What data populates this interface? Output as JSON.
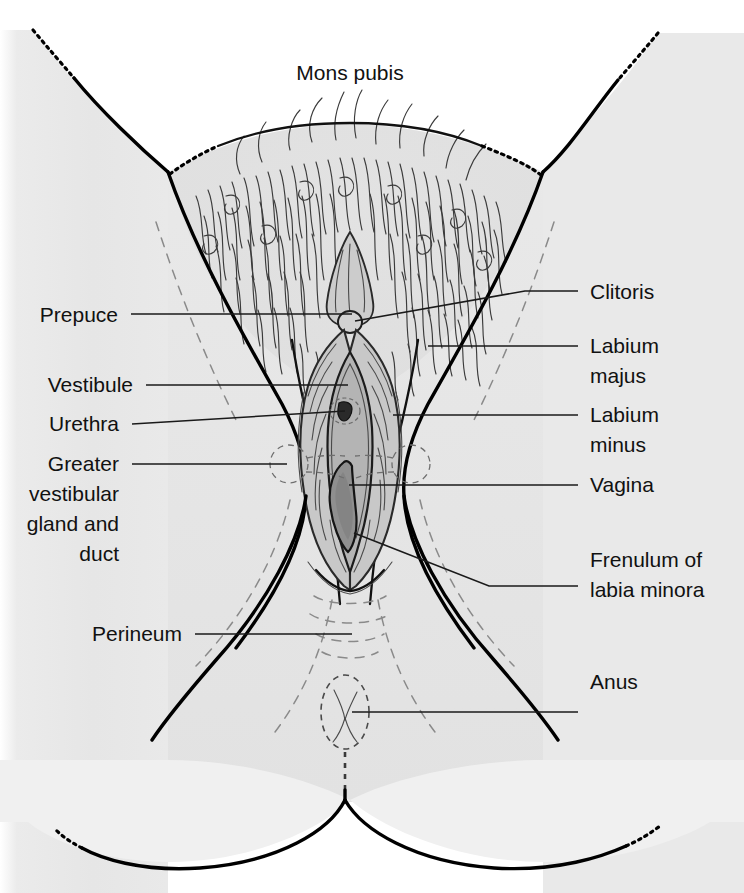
{
  "figure": {
    "view": "anterior / lithotomy view",
    "style": "line drawing with grayscale shading"
  },
  "colors": {
    "background": "#ffffff",
    "skin_fill": "#e4e4e4",
    "skin_fill_light": "#ededed",
    "labium_minus_fill": "#c8c8c8",
    "vestibule_fill": "#b4b4b4",
    "vaginal_opening_fill": "#8f8f8f",
    "outline": "#000000",
    "leader_line": "#1a1a1a",
    "text": "#111111",
    "hair": "#3b3b3b",
    "dashed_guide": "#8a8a8a"
  },
  "labels": {
    "top": [
      {
        "id": "mons-pubis",
        "text": "Mons pubis",
        "x": 350,
        "y": 80,
        "align": "center",
        "has_leader": false
      }
    ],
    "left": [
      {
        "id": "prepuce",
        "text": "Prepuce",
        "x": 118,
        "y": 322,
        "align": "end",
        "leader": "M 131 314 L 352 314"
      },
      {
        "id": "vestibule",
        "text": "Vestibule",
        "x": 133,
        "y": 392,
        "align": "end",
        "leader": "M 146 385 L 348 385"
      },
      {
        "id": "urethra",
        "text": "Urethra",
        "x": 119,
        "y": 431,
        "align": "end",
        "leader": "M 132 424 L 345 411"
      },
      {
        "id": "greater-vestibular-gland-and-duct",
        "text": "Greater",
        "lines": [
          "Greater",
          "vestibular",
          "gland and",
          "duct"
        ],
        "x": 119,
        "y": 471,
        "align": "end",
        "line_y": [
          471,
          501,
          531,
          561
        ],
        "leader": "M 132 464 L 287 464"
      },
      {
        "id": "perineum",
        "text": "Perineum",
        "x": 182,
        "y": 641,
        "align": "end",
        "leader": "M 195 634 L 352 634"
      }
    ],
    "right": [
      {
        "id": "clitoris",
        "text": "Clitoris",
        "x": 590,
        "y": 299,
        "align": "start",
        "leader": "M 355 321 L 525 291 L 578 291"
      },
      {
        "id": "labium-majus",
        "text": "Labium majus",
        "lines": [
          "Labium",
          "majus"
        ],
        "x": 590,
        "y": 353,
        "align": "start",
        "line_y": [
          353,
          383
        ],
        "leader": "M 428 346 L 578 346"
      },
      {
        "id": "labium-minus",
        "text": "Labium minus",
        "lines": [
          "Labium",
          "minus"
        ],
        "x": 590,
        "y": 422,
        "align": "start",
        "line_y": [
          422,
          452
        ],
        "leader": "M 393 415 L 578 415"
      },
      {
        "id": "vagina",
        "text": "Vagina",
        "x": 590,
        "y": 492,
        "align": "start",
        "leader": "M 349 485 L 578 485"
      },
      {
        "id": "frenulum-of-labia-minora",
        "text": "Frenulum of labia minora",
        "lines": [
          "Frenulum of",
          "labia minora"
        ],
        "x": 590,
        "y": 567,
        "align": "start",
        "line_y": [
          567,
          597
        ],
        "leader": "M 354 533 L 489 586 L 578 586"
      },
      {
        "id": "anus",
        "text": "Anus",
        "x": 590,
        "y": 689,
        "align": "start",
        "leader": "M 352 712 L 578 712"
      }
    ]
  },
  "structures": [
    {
      "id": "mons-pubis",
      "name": "Mons pubis",
      "description": "hair-covered rounded eminence at top"
    },
    {
      "id": "prepuce",
      "name": "Prepuce",
      "description": "clitoral hood folds"
    },
    {
      "id": "clitoris",
      "name": "Clitoris",
      "description": "small rounded glans at apex of vestibule"
    },
    {
      "id": "labium-majus",
      "name": "Labium majus",
      "description": "outer lip, hair-bearing"
    },
    {
      "id": "labium-minus",
      "name": "Labium minus",
      "description": "inner lip bordering the vestibule"
    },
    {
      "id": "vestibule",
      "name": "Vestibule",
      "description": "region enclosed by labia minora"
    },
    {
      "id": "urethra",
      "name": "Urethra",
      "description": "external urethral orifice"
    },
    {
      "id": "vagina",
      "name": "Vagina",
      "description": "vaginal orifice / introitus"
    },
    {
      "id": "greater-vestibular-gland-and-duct",
      "name": "Greater vestibular gland and duct",
      "description": "paired dashed circles lateral to the vaginal orifice with dashed ducts"
    },
    {
      "id": "frenulum-of-labia-minora",
      "name": "Frenulum of labia minora",
      "description": "posterior junction of the labia minora"
    },
    {
      "id": "perineum",
      "name": "Perineum",
      "description": "area between vaginal orifice and anus"
    },
    {
      "id": "anus",
      "name": "Anus",
      "description": "dashed oval with radiating folds"
    }
  ]
}
